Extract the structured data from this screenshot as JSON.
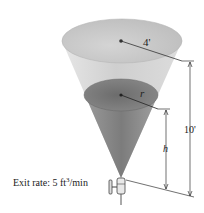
{
  "diagram": {
    "labels": {
      "top_radius": "4'",
      "water_radius": "r",
      "height_total": "10'",
      "water_height": "h"
    },
    "exit_rate": {
      "prefix": "Exit rate: 5 ft",
      "exponent": "3",
      "suffix": "/min"
    },
    "colors": {
      "tank_light": "#d9d9d9",
      "tank_dark": "#8a8a8a",
      "water_surface": "#7a7a7a",
      "line": "#333333"
    }
  }
}
